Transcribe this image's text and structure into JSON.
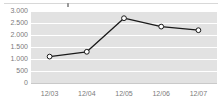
{
  "widget": {
    "name": "line-chart-widget",
    "background_color": "#ffffff",
    "plot_background_color": "#e2e2e2",
    "gridline_color": "#ffffff",
    "axis_label_color": "#7b7b7b",
    "top_rule_color": "#d8d8d8"
  },
  "chart_data": {
    "type": "line",
    "title": "",
    "subtitle": "",
    "xlabel": "",
    "ylabel": "",
    "categories": [
      "12/03",
      "12/04",
      "12/05",
      "12/06",
      "12/07"
    ],
    "values": [
      1100,
      1300,
      2700,
      2350,
      2200
    ],
    "series": [
      {
        "name": "series-1",
        "values": [
          1100,
          1300,
          2700,
          2350,
          2200
        ],
        "line_color": "#1a1a1a",
        "marker": "open-circle",
        "marker_fill": "#ffffff",
        "marker_stroke": "#1a1a1a"
      }
    ],
    "ylim": [
      0,
      3000
    ],
    "ytick_values": [
      3000,
      2500,
      2000,
      1500,
      1000,
      500,
      0
    ],
    "ytick_labels": [
      "3.000",
      "2.500",
      "2.000",
      "1.500",
      "1.000",
      "500",
      "0"
    ],
    "xtick_labels": [
      "12/03",
      "12/04",
      "12/05",
      "12/06",
      "12/07"
    ],
    "grid": true,
    "grid_axis": "y",
    "legend": false,
    "legend_position": "none"
  }
}
